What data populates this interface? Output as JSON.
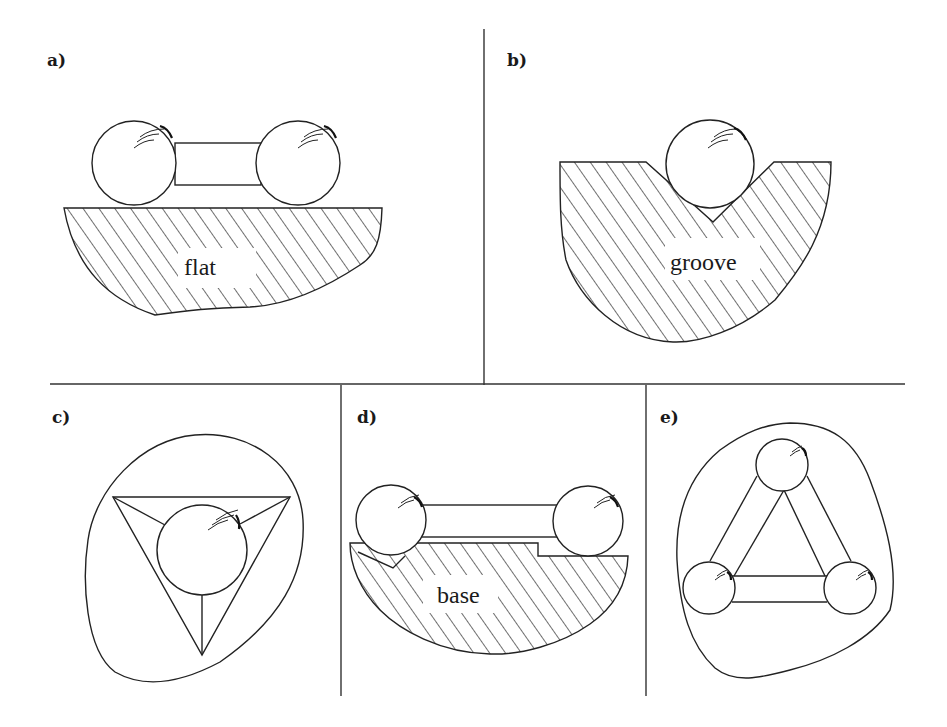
{
  "figure": {
    "panels": [
      {
        "label": "a)",
        "surface_label": "flat",
        "description": "two-ball rod resting on flat surface"
      },
      {
        "label": "b)",
        "surface_label": "groove",
        "description": "ball resting in V-groove"
      },
      {
        "label": "c)",
        "surface_label": "",
        "description": "ball in trihedral (tetrahedral) hole"
      },
      {
        "label": "d)",
        "surface_label": "base",
        "description": "two-ball rod on base with groove and flat"
      },
      {
        "label": "e)",
        "surface_label": "",
        "description": "three balls joined by rods in triangle"
      }
    ],
    "colors": {
      "ink": "#222222",
      "background": "#ffffff"
    }
  }
}
